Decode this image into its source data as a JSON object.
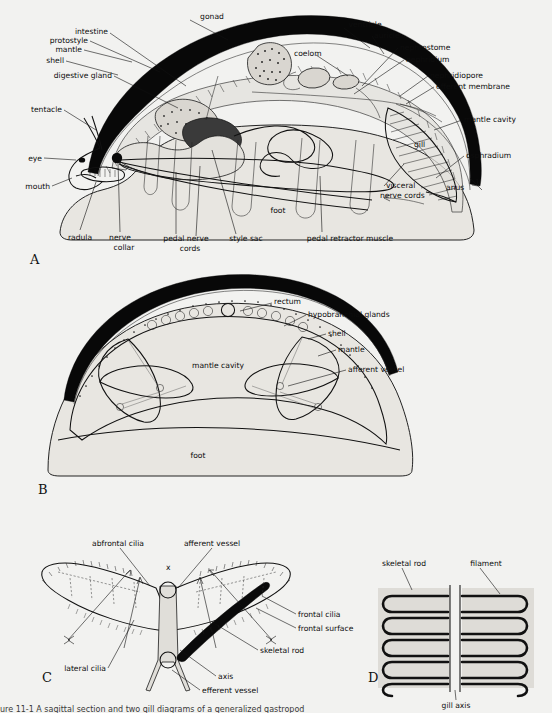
{
  "figure": {
    "background_color": "#f2f2f0",
    "ink_color": "#111111",
    "shell_color": "#080808",
    "caption_partial": "ure 11-1      A sagittal section and two gill diagrams of a generalized gastropod"
  },
  "panels": [
    {
      "id": "A",
      "letter": "A",
      "title": "sagittal section of generalized gastropod"
    },
    {
      "id": "B",
      "letter": "B",
      "title": "transverse section through mantle cavity"
    },
    {
      "id": "C",
      "letter": "C",
      "title": "gill filament pair, ciliary currents"
    },
    {
      "id": "D",
      "letter": "D",
      "title": "gill axis with filaments"
    }
  ],
  "panelA": {
    "letter": "A",
    "labels": [
      {
        "key": "shell",
        "text": "shell"
      },
      {
        "key": "mantle",
        "text": "mantle"
      },
      {
        "key": "protostyle",
        "text": "protostyle"
      },
      {
        "key": "intestine",
        "text": "intestine"
      },
      {
        "key": "gonad",
        "text": "gonad"
      },
      {
        "key": "ventricle",
        "text": "ventricle"
      },
      {
        "key": "auricle",
        "text": "auricle"
      },
      {
        "key": "nephrostome",
        "text": "nephrostome"
      },
      {
        "key": "nephridium",
        "text": "nephridium"
      },
      {
        "key": "nephridiopore",
        "text": "nephridiopore"
      },
      {
        "key": "efferent_membrane",
        "text": "efferent membrane"
      },
      {
        "key": "mantle_cavity",
        "text": "mantle cavity"
      },
      {
        "key": "osphradium",
        "text": "osphradium"
      },
      {
        "key": "anus",
        "text": "anus"
      },
      {
        "key": "gill",
        "text": "gill"
      },
      {
        "key": "coelom",
        "text": "coelom"
      },
      {
        "key": "digestive_gland",
        "text": "digestive gland"
      },
      {
        "key": "tentacle",
        "text": "tentacle"
      },
      {
        "key": "eye",
        "text": "eye"
      },
      {
        "key": "mouth",
        "text": "mouth"
      },
      {
        "key": "radula",
        "text": "radula"
      },
      {
        "key": "nerve_collar_1",
        "text": "nerve"
      },
      {
        "key": "nerve_collar_2",
        "text": "collar"
      },
      {
        "key": "pedal_nerve_1",
        "text": "pedal nerve"
      },
      {
        "key": "pedal_nerve_2",
        "text": "cords"
      },
      {
        "key": "style_sac",
        "text": "style sac"
      },
      {
        "key": "pedal_retractor",
        "text": "pedal retractor muscle"
      },
      {
        "key": "visceral_1",
        "text": "visceral"
      },
      {
        "key": "visceral_2",
        "text": "nerve cords"
      },
      {
        "key": "foot",
        "text": "foot"
      }
    ]
  },
  "panelB": {
    "letter": "B",
    "labels": [
      {
        "key": "rectum",
        "text": "rectum"
      },
      {
        "key": "hypobranchial",
        "text": "hypobranchial glands"
      },
      {
        "key": "shell",
        "text": "shell"
      },
      {
        "key": "mantle",
        "text": "mantle"
      },
      {
        "key": "afferent_vessel",
        "text": "afferent vessel"
      },
      {
        "key": "mantle_cavity",
        "text": "mantle cavity"
      },
      {
        "key": "foot",
        "text": "foot"
      }
    ]
  },
  "panelC": {
    "letter": "C",
    "marker": "x",
    "labels": [
      {
        "key": "abfrontal_cilia",
        "text": "abfrontal cilia"
      },
      {
        "key": "afferent_vessel",
        "text": "afferent vessel"
      },
      {
        "key": "frontal_cilia",
        "text": "frontal cilia"
      },
      {
        "key": "frontal_surface",
        "text": "frontal surface"
      },
      {
        "key": "skeletal_rod",
        "text": "skeletal rod"
      },
      {
        "key": "axis",
        "text": "axis"
      },
      {
        "key": "efferent_vessel",
        "text": "efferent vessel"
      },
      {
        "key": "lateral_cilia",
        "text": "lateral cilia"
      }
    ]
  },
  "panelD": {
    "letter": "D",
    "labels": [
      {
        "key": "skeletal_rod",
        "text": "skeletal rod"
      },
      {
        "key": "filament",
        "text": "filament"
      },
      {
        "key": "gill_axis",
        "text": "gill axis"
      }
    ]
  }
}
